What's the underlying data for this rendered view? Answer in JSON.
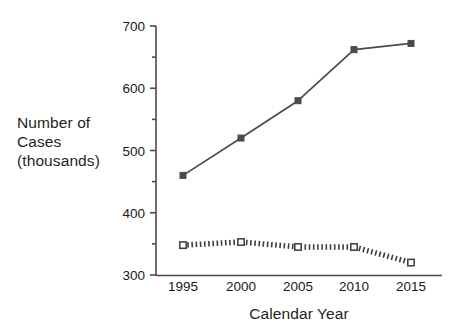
{
  "chart_data": {
    "type": "line",
    "title": "",
    "xlabel": "Calendar Year",
    "ylabel": "Number of\nCases\n(thousands)",
    "ylabel_lines": [
      "Number of",
      "Cases",
      "(thousands)"
    ],
    "x": [
      1995,
      2000,
      2005,
      2010,
      2015
    ],
    "categories": [
      "1995",
      "2000",
      "2005",
      "2010",
      "2015"
    ],
    "xtick_labels": [
      "1995",
      "2000",
      "2005",
      "2010",
      "2015"
    ],
    "ytick_labels": [
      "300",
      "400",
      "500",
      "600",
      "700"
    ],
    "ytick_values": [
      300,
      400,
      500,
      600,
      700
    ],
    "yminor_values": [
      350,
      450,
      550,
      650
    ],
    "ylim": [
      300,
      700
    ],
    "xlim": [
      1993,
      2018
    ],
    "grid": false,
    "legend": "none",
    "series": [
      {
        "name": "series-solid",
        "style": "solid",
        "marker": "filled-square",
        "color": "#4a4a4a",
        "values": [
          460,
          520,
          580,
          662,
          672
        ]
      },
      {
        "name": "series-dotted",
        "style": "dotted",
        "marker": "open-square",
        "color": "#3d3d3d",
        "values": [
          348,
          353,
          345,
          345,
          320
        ]
      }
    ]
  },
  "colors": {
    "axis": "#4a4a4a",
    "text": "#1a1a1a",
    "series_solid": "#4a4a4a",
    "series_dotted": "#3d3d3d",
    "background": "#ffffff"
  }
}
